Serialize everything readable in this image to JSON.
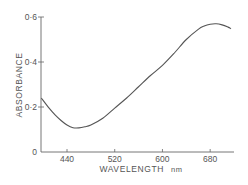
{
  "chart_data": {
    "type": "line",
    "title": "",
    "xlabel": "WAVELENGTH",
    "xlabel_unit": "nm",
    "ylabel": "ABSORBANCE",
    "xlim": [
      397,
      720
    ],
    "ylim": [
      0,
      0.6
    ],
    "x_ticks": [
      440,
      520,
      600,
      680
    ],
    "x_tick_labels": [
      "440",
      "520",
      "600",
      "680"
    ],
    "y_ticks": [
      0,
      0.2,
      0.4,
      0.6
    ],
    "y_tick_labels": [
      "0",
      "0·2",
      "0·4",
      "0·6"
    ],
    "grid": false,
    "legend": null,
    "series": [
      {
        "name": "absorbance",
        "x": [
          397,
          410,
          420,
          430,
          440,
          450,
          460,
          470,
          480,
          500,
          520,
          540,
          560,
          580,
          600,
          620,
          640,
          660,
          670,
          680,
          690,
          700,
          710,
          715
        ],
        "y": [
          0.24,
          0.195,
          0.165,
          0.14,
          0.12,
          0.108,
          0.107,
          0.112,
          0.12,
          0.15,
          0.195,
          0.24,
          0.29,
          0.34,
          0.385,
          0.44,
          0.5,
          0.545,
          0.56,
          0.568,
          0.57,
          0.565,
          0.555,
          0.548
        ]
      }
    ]
  }
}
